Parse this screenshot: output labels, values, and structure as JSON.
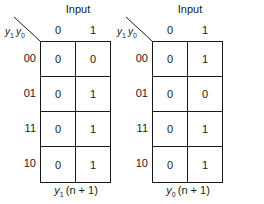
{
  "maps": [
    {
      "id": "y1",
      "input_label": "Input",
      "row_var_label": {
        "a": "y",
        "a_sub": "1",
        "b": "y",
        "b_sub": "0"
      },
      "columns": [
        "0",
        "1"
      ],
      "rows": [
        {
          "label": "00",
          "cells": [
            "0",
            "0"
          ]
        },
        {
          "label": "01",
          "cells": [
            "0",
            "1"
          ]
        },
        {
          "label": "11",
          "cells": [
            "0",
            "1"
          ]
        },
        {
          "label": "10",
          "cells": [
            "0",
            "1"
          ]
        }
      ],
      "caption": {
        "var": "y",
        "sub": "1",
        "rest": "(n + 1)"
      }
    },
    {
      "id": "y0",
      "input_label": "Input",
      "row_var_label": {
        "a": "y",
        "a_sub": "1",
        "b": "y",
        "b_sub": "0"
      },
      "columns": [
        "0",
        "1"
      ],
      "rows": [
        {
          "label": "00",
          "cells": [
            "0",
            "1"
          ]
        },
        {
          "label": "01",
          "cells": [
            "0",
            "0"
          ]
        },
        {
          "label": "11",
          "cells": [
            "0",
            "1"
          ]
        },
        {
          "label": "10",
          "cells": [
            "0",
            "1"
          ]
        }
      ],
      "caption": {
        "var": "y",
        "sub": "0",
        "rest": "(n + 1)"
      }
    }
  ]
}
